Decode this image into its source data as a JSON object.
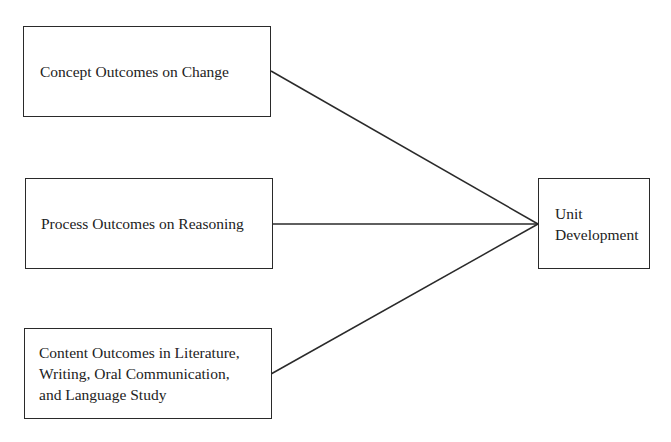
{
  "diagram": {
    "type": "flow",
    "nodes": [
      {
        "id": "concept",
        "label": "Concept Outcomes on Change"
      },
      {
        "id": "process",
        "label": "Process Outcomes on Reasoning"
      },
      {
        "id": "content",
        "label": "Content Outcomes in Literature,\nWriting, Oral Communication,\nand Language Study"
      },
      {
        "id": "unit",
        "label": "Unit\nDevelopment"
      }
    ],
    "edges": [
      {
        "from": "concept",
        "to": "unit"
      },
      {
        "from": "process",
        "to": "unit"
      },
      {
        "from": "content",
        "to": "unit"
      }
    ],
    "line_color": "#2a2a2a"
  }
}
